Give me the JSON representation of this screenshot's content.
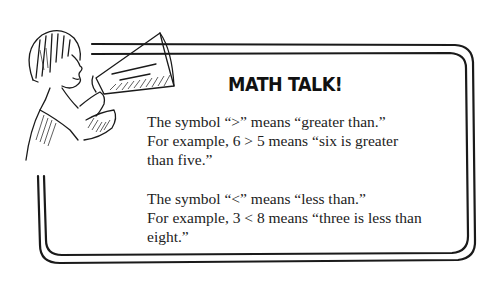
{
  "callout": {
    "title": "MATH TALK!",
    "paragraphs": [
      {
        "lines": [
          "The symbol “>” means “greater than.”",
          "For example, 6 > 5 means “six is greater",
          "than five.”"
        ]
      },
      {
        "lines": [
          "The symbol “<” means “less than.”",
          "For example, 3 < 8 means “three is less than",
          "eight.”"
        ]
      }
    ]
  },
  "illustration": {
    "icon": "child-with-megaphone-icon",
    "description": "Child shouting into a megaphone"
  }
}
